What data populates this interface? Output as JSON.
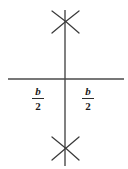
{
  "figure": {
    "kind": "geometry-construction",
    "background_color": "#ffffff",
    "line_color": "#4a4a4a",
    "mark_color": "#3a3a3a",
    "text_color": "#1a1a1a"
  },
  "lines": {
    "horizontal": {
      "name": "horizontal-baseline",
      "x1": 8,
      "y1": 79,
      "x2": 124,
      "y2": 79,
      "stroke_width": 1.3
    },
    "vertical": {
      "name": "vertical-bisector",
      "x1": 65,
      "y1": 10,
      "x2": 65,
      "y2": 166,
      "stroke_width": 1.4
    }
  },
  "arc_marks": [
    {
      "name": "upper-arc-intersection",
      "center_x": 65,
      "center_y": 21,
      "strokes": [
        {
          "x1": 52,
          "y1": 11,
          "x2": 79,
          "y2": 33
        },
        {
          "x1": 79,
          "y1": 11,
          "x2": 52,
          "y2": 33
        }
      ]
    },
    {
      "name": "lower-arc-intersection",
      "center_x": 65,
      "center_y": 148,
      "strokes": [
        {
          "x1": 52,
          "y1": 137,
          "x2": 79,
          "y2": 160
        },
        {
          "x1": 79,
          "y1": 137,
          "x2": 52,
          "y2": 160
        }
      ]
    }
  ],
  "labels": {
    "left": {
      "name": "length-label-left",
      "numerator": "b",
      "denominator": "2",
      "full_text": "b/2"
    },
    "right": {
      "name": "length-label-right",
      "numerator": "b",
      "denominator": "2",
      "full_text": "b/2"
    }
  }
}
